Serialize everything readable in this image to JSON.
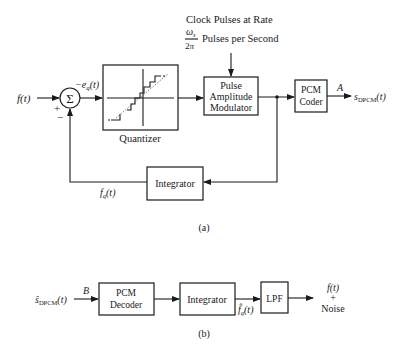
{
  "diagram_a": {
    "caption": "(a)",
    "input_label": "f(t)",
    "summer": {
      "symbol": "Σ",
      "plus_sign": "+",
      "minus_sign": "−"
    },
    "error_label": "−e",
    "error_sub": "q",
    "error_arg": "(t)",
    "quantizer": {
      "label": "Quantizer"
    },
    "clock": {
      "line1": "Clock Pulses at Rate",
      "frac_num": "ω",
      "frac_num_sub": "s",
      "frac_den": "2π",
      "line2": "Pulses per Second"
    },
    "pam": {
      "line1": "Pulse",
      "line2": "Amplitude",
      "line3": "Modulator"
    },
    "pcm_coder": {
      "line1": "PCM",
      "line2": "Coder"
    },
    "point_label": "A",
    "output_label": "s",
    "output_sub": "DPCM",
    "output_arg": "(t)",
    "integrator": {
      "label": "Integrator"
    },
    "feedback_label": "f",
    "feedback_sub": "q",
    "feedback_arg": "(t)"
  },
  "diagram_b": {
    "caption": "(b)",
    "input_label": "ŝ",
    "input_sub": "DPCM",
    "input_arg": "(t)",
    "point_label": "B",
    "pcm_decoder": {
      "line1": "PCM",
      "line2": "Decoder"
    },
    "integrator": {
      "label": "Integrator"
    },
    "mid_label": "f̂",
    "mid_sub": "q",
    "mid_arg": "(t)",
    "lpf": {
      "label": "LPF"
    },
    "output": {
      "line1": "f(t)",
      "line2": "+",
      "line3": "Noise"
    }
  }
}
